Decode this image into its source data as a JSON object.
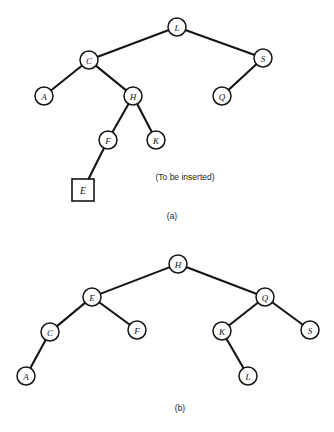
{
  "figure": {
    "background_color": "#ffffff",
    "stroke_color": "#141414",
    "panels": [
      {
        "id": "a",
        "label": "(a)",
        "label_x": 172,
        "label_y": 216,
        "annotation": "(To be inserted)",
        "annotation_x": 185,
        "annotation_y": 177,
        "nodes": [
          {
            "id": "a-L",
            "label": "L",
            "x": 177,
            "y": 27,
            "r": 9,
            "shape": "circle"
          },
          {
            "id": "a-C",
            "label": "C",
            "x": 89,
            "y": 60,
            "r": 9,
            "shape": "circle"
          },
          {
            "id": "a-S",
            "label": "S",
            "x": 263,
            "y": 58,
            "r": 9,
            "shape": "circle"
          },
          {
            "id": "a-A",
            "label": "A",
            "x": 44,
            "y": 96,
            "r": 9,
            "shape": "circle"
          },
          {
            "id": "a-H",
            "label": "H",
            "x": 133,
            "y": 96,
            "r": 9,
            "shape": "circle"
          },
          {
            "id": "a-Q",
            "label": "Q",
            "x": 222,
            "y": 96,
            "r": 9,
            "shape": "circle"
          },
          {
            "id": "a-F",
            "label": "F",
            "x": 108,
            "y": 140,
            "r": 9,
            "shape": "circle"
          },
          {
            "id": "a-K",
            "label": "K",
            "x": 156,
            "y": 140,
            "r": 9,
            "shape": "circle"
          },
          {
            "id": "a-E",
            "label": "E",
            "x": 83,
            "y": 190,
            "r": 11,
            "shape": "square"
          }
        ],
        "edges": [
          {
            "from": "a-L",
            "to": "a-C"
          },
          {
            "from": "a-L",
            "to": "a-S"
          },
          {
            "from": "a-C",
            "to": "a-A"
          },
          {
            "from": "a-C",
            "to": "a-H"
          },
          {
            "from": "a-S",
            "to": "a-Q"
          },
          {
            "from": "a-H",
            "to": "a-F"
          },
          {
            "from": "a-H",
            "to": "a-K"
          },
          {
            "from": "a-F",
            "to": "a-E"
          }
        ]
      },
      {
        "id": "b",
        "label": "(b)",
        "label_x": 180,
        "label_y": 408,
        "annotation": "",
        "annotation_x": 0,
        "annotation_y": 0,
        "nodes": [
          {
            "id": "b-H",
            "label": "H",
            "x": 178,
            "y": 264,
            "r": 9,
            "shape": "circle"
          },
          {
            "id": "b-E",
            "label": "E",
            "x": 92,
            "y": 297,
            "r": 9,
            "shape": "circle"
          },
          {
            "id": "b-Q",
            "label": "Q",
            "x": 265,
            "y": 297,
            "r": 9,
            "shape": "circle"
          },
          {
            "id": "b-C",
            "label": "C",
            "x": 50,
            "y": 332,
            "r": 9,
            "shape": "circle"
          },
          {
            "id": "b-F",
            "label": "F",
            "x": 137,
            "y": 330,
            "r": 9,
            "shape": "circle"
          },
          {
            "id": "b-K",
            "label": "K",
            "x": 222,
            "y": 331,
            "r": 9,
            "shape": "circle"
          },
          {
            "id": "b-S",
            "label": "S",
            "x": 310,
            "y": 330,
            "r": 9,
            "shape": "circle"
          },
          {
            "id": "b-A",
            "label": "A",
            "x": 26,
            "y": 376,
            "r": 9,
            "shape": "circle"
          },
          {
            "id": "b-L",
            "label": "L",
            "x": 248,
            "y": 376,
            "r": 9,
            "shape": "circle"
          }
        ],
        "edges": [
          {
            "from": "b-H",
            "to": "b-E"
          },
          {
            "from": "b-H",
            "to": "b-Q"
          },
          {
            "from": "b-E",
            "to": "b-C"
          },
          {
            "from": "b-E",
            "to": "b-F"
          },
          {
            "from": "b-Q",
            "to": "b-K"
          },
          {
            "from": "b-Q",
            "to": "b-S"
          },
          {
            "from": "b-C",
            "to": "b-A"
          },
          {
            "from": "b-K",
            "to": "b-L"
          }
        ]
      }
    ]
  }
}
